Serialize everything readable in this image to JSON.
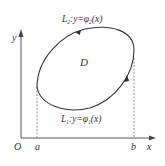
{
  "diagram": {
    "region_label": "D",
    "upper_curve": {
      "name": "L",
      "sub": "2",
      "eq": ":y=φ",
      "eqsub": "2",
      "arg": "(x)"
    },
    "lower_curve": {
      "name": "L",
      "sub": "1",
      "eq": ":y=φ",
      "eqsub": "1",
      "arg": "(x)"
    },
    "axes": {
      "x_label": "x",
      "y_label": "y",
      "origin_label": "O"
    },
    "points": {
      "a": "a",
      "b": "b"
    }
  }
}
